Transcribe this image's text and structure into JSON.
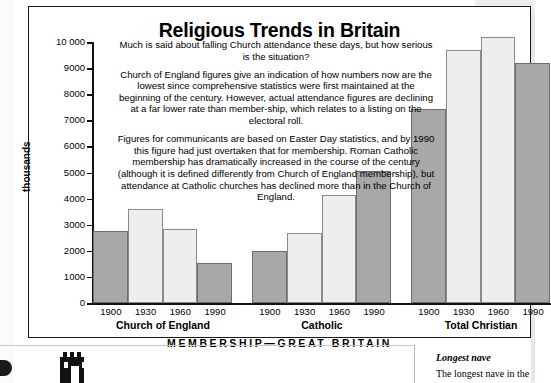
{
  "title": "Religious Trends in Britain",
  "yaxis_title": "thousands",
  "footer": "MEMBERSHIP—GREAT BRITAIN",
  "paragraphs": [
    "Much is said about falling Church attendance these days, but how serious is the situation?",
    "Church of England figures give an indication of how numbers now are the lowest since comprehensive statistics were first maintained at the beginning of the century. However, actual attendance figures are declining at a far lower rate than member-ship, which relates to a listing on the electoral roll.",
    "Figures for communicants are based on Easter Day statistics, and by 1990 this figure had just overtaken that for membership. Roman Catholic membership has dramatically increased in the course of the century (although it is defined differently from Church of England membership), but attendance at Catholic churches has declined more than in the Church of England."
  ],
  "sidebar": {
    "nave_heading": "Longest nave",
    "nave_text": "The longest nave in the"
  },
  "colors": {
    "bar_dark": "#a8a8a8",
    "bar_light": "#eeeeee",
    "axis": "#111111",
    "panel_border": "#1a1a1a"
  },
  "chart_data": {
    "type": "bar",
    "title": "Religious Trends in Britain",
    "xlabel": "MEMBERSHIP—GREAT BRITAIN",
    "ylabel": "thousands",
    "ylim": [
      0,
      10000
    ],
    "ytick_labels": [
      "10 000",
      "9000",
      "8000",
      "7000",
      "6000",
      "5000",
      "4000",
      "3000",
      "2000",
      "1000",
      "0"
    ],
    "ytick_values": [
      10000,
      9000,
      8000,
      7000,
      6000,
      5000,
      4000,
      3000,
      2000,
      1000,
      0
    ],
    "grid": false,
    "legend": "none",
    "categories": [
      "1900",
      "1930",
      "1960",
      "1990"
    ],
    "groups": [
      {
        "name": "Church of England",
        "bars": [
          {
            "label": "1900",
            "value": 2750,
            "shade": "dark"
          },
          {
            "label": "1930",
            "value": 3600,
            "shade": "light"
          },
          {
            "label": "1960",
            "value": 2850,
            "shade": "light"
          },
          {
            "label": "1990",
            "value": 1550,
            "shade": "dark"
          }
        ]
      },
      {
        "name": "Catholic",
        "bars": [
          {
            "label": "1900",
            "value": 2000,
            "shade": "dark"
          },
          {
            "label": "1930",
            "value": 2700,
            "shade": "light"
          },
          {
            "label": "1960",
            "value": 4150,
            "shade": "light"
          },
          {
            "label": "1990",
            "value": 5050,
            "shade": "dark"
          }
        ]
      },
      {
        "name": "Total Christian",
        "bars": [
          {
            "label": "1900",
            "value": 7450,
            "shade": "dark"
          },
          {
            "label": "1930",
            "value": 9700,
            "shade": "light"
          },
          {
            "label": "1960",
            "value": 10200,
            "shade": "light"
          },
          {
            "label": "1990",
            "value": 9200,
            "shade": "dark"
          }
        ]
      }
    ]
  }
}
